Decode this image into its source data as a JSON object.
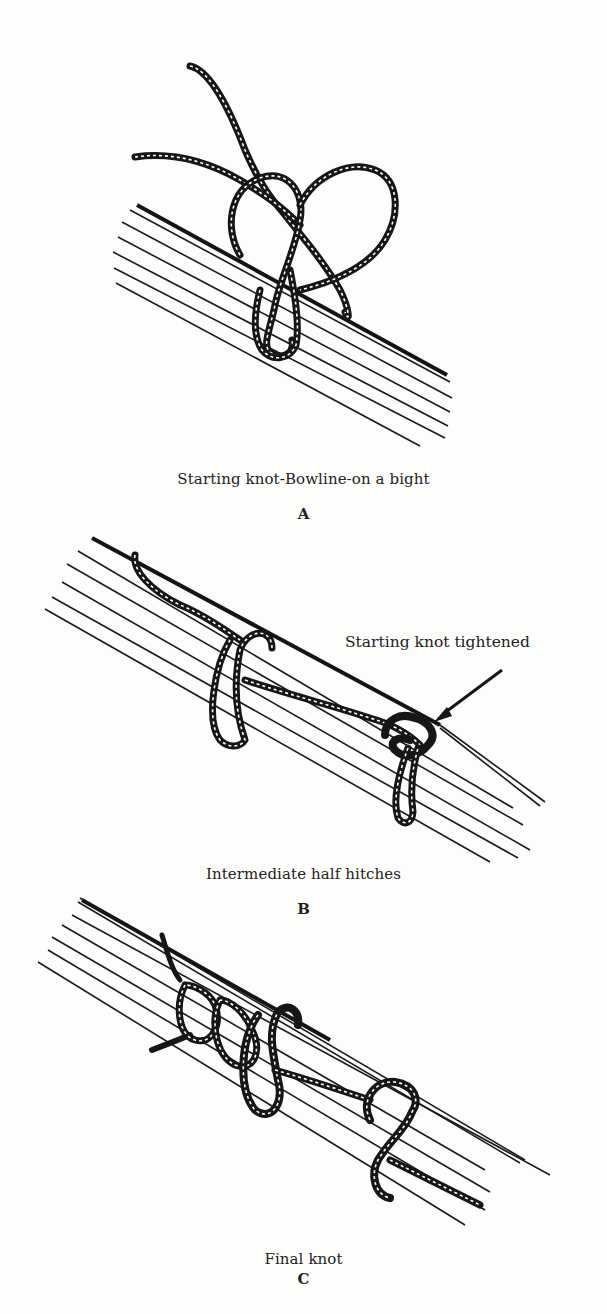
{
  "figures": [
    {
      "id": "A",
      "caption": "Starting knot-Bowline-on a bight",
      "letter": "A"
    },
    {
      "id": "B",
      "caption": "Intermediate half hitches",
      "letter": "B",
      "callout": "Starting knot tightened"
    },
    {
      "id": "C",
      "caption": "Final knot",
      "letter": "C"
    }
  ],
  "colors": {
    "ink": "#161616",
    "paper": "#fdfdfb"
  }
}
